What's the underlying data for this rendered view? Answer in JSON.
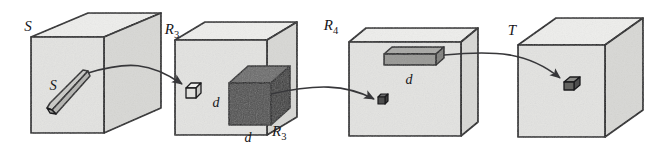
{
  "figure": {
    "caption_text": "",
    "boxes": [
      {
        "id": "box-s",
        "label": "S",
        "subscript": "",
        "inner_label": "S"
      },
      {
        "id": "box-r3",
        "label": "R",
        "subscript": "3",
        "inner_label": ""
      },
      {
        "id": "box-r4",
        "label": "R",
        "subscript": "4",
        "inner_label": ""
      },
      {
        "id": "box-t",
        "label": "T",
        "subscript": "",
        "inner_label": ""
      }
    ],
    "annotations": {
      "dark_cube_left_dim": "d",
      "dark_cube_bottom_dim": "d",
      "dark_cube_name": "R",
      "dark_cube_name_subscript": "3",
      "slab_dim": "d"
    },
    "colors": {
      "face_front": "#e3e3e1",
      "face_top": "#eeeeec",
      "face_right": "#d8d8d5",
      "outline": "#1b1b1d",
      "dark_solid_front": "#4e4e4e",
      "dark_solid_top": "#6a6a6a",
      "dark_solid_right": "#3c3c3c",
      "arrow": "#37373a",
      "paper": "#ffffff"
    }
  }
}
